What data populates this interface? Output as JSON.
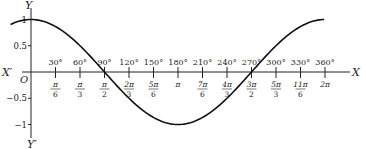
{
  "chart_data": {
    "type": "line",
    "title": "",
    "xlabel": "X",
    "ylabel": "Y",
    "axis_labels": {
      "x_pos": "X",
      "x_neg": "X′",
      "y_pos": "Y",
      "y_neg": "Y′",
      "origin": "O"
    },
    "y_ticks": [
      {
        "v": 1,
        "label": "1"
      },
      {
        "v": 0.5,
        "label": "0.5"
      },
      {
        "v": -0.5,
        "label": "−0.5"
      },
      {
        "v": -1,
        "label": "−1"
      }
    ],
    "x_ticks": [
      {
        "deg": 30,
        "deg_label": "30°",
        "rad_num": "π",
        "rad_den": "6"
      },
      {
        "deg": 60,
        "deg_label": "60°",
        "rad_num": "π",
        "rad_den": "3"
      },
      {
        "deg": 90,
        "deg_label": "90°",
        "rad_num": "π",
        "rad_den": "2"
      },
      {
        "deg": 120,
        "deg_label": "120°",
        "rad_num": "2π",
        "rad_den": "3"
      },
      {
        "deg": 150,
        "deg_label": "150°",
        "rad_num": "5π",
        "rad_den": "6"
      },
      {
        "deg": 180,
        "deg_label": "180°",
        "rad_num": "π",
        "rad_den": ""
      },
      {
        "deg": 210,
        "deg_label": "210°",
        "rad_num": "7π",
        "rad_den": "6"
      },
      {
        "deg": 240,
        "deg_label": "240°",
        "rad_num": "4π",
        "rad_den": "3"
      },
      {
        "deg": 270,
        "deg_label": "270°",
        "rad_num": "3π",
        "rad_den": "2"
      },
      {
        "deg": 300,
        "deg_label": "300°",
        "rad_num": "5π",
        "rad_den": "3"
      },
      {
        "deg": 330,
        "deg_label": "330°",
        "rad_num": "11π",
        "rad_den": "6"
      },
      {
        "deg": 360,
        "deg_label": "360°",
        "rad_num": "2π",
        "rad_den": ""
      }
    ],
    "series": [
      {
        "name": "y = cos x",
        "function": "cos",
        "x_range_deg": [
          -25,
          360
        ],
        "values_at_ticks": [
          1,
          0.866,
          0.5,
          0,
          -0.5,
          -0.866,
          -1,
          -0.866,
          -0.5,
          0,
          0.5,
          0.866,
          1
        ]
      }
    ],
    "xlim_deg": [
      -35,
      370
    ],
    "ylim": [
      -1.1,
      1.15
    ],
    "grid": false,
    "legend": "none"
  }
}
